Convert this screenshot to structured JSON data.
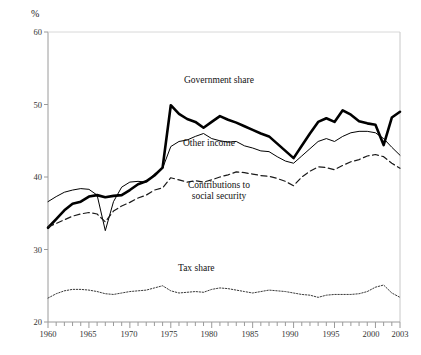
{
  "chart_data": {
    "type": "line",
    "title": "",
    "xlabel": "",
    "ylabel": "%",
    "yunit_label": "%",
    "xlim": [
      1960,
      2003
    ],
    "ylim": [
      20,
      60
    ],
    "grid": false,
    "legend_position": "inline-annotations",
    "y_ticks": [
      20,
      30,
      40,
      50,
      60
    ],
    "y_tick_labels": [
      "20",
      "30",
      "40",
      "50",
      "60"
    ],
    "x_ticks": [
      1960,
      1965,
      1970,
      1975,
      1980,
      1985,
      1990,
      1995,
      2000,
      2003
    ],
    "x_tick_labels": [
      "1960",
      "1965",
      "1970",
      "1975",
      "1980",
      "1985",
      "1990",
      "1995",
      "2000",
      "2003"
    ],
    "x_minor_tick_interval": 1,
    "x": [
      1960,
      1961,
      1962,
      1963,
      1964,
      1965,
      1966,
      1967,
      1968,
      1969,
      1970,
      1971,
      1972,
      1973,
      1974,
      1975,
      1976,
      1977,
      1978,
      1979,
      1980,
      1981,
      1982,
      1983,
      1984,
      1985,
      1986,
      1987,
      1988,
      1989,
      1990,
      1991,
      1992,
      1993,
      1994,
      1995,
      1996,
      1997,
      1998,
      1999,
      2000,
      2001,
      2002,
      2003
    ],
    "series": [
      {
        "name": "Government share",
        "style": "thick-solid",
        "color": "#000000",
        "width": 2.6,
        "values": [
          33.0,
          34.2,
          35.4,
          36.3,
          36.6,
          37.3,
          37.5,
          37.2,
          37.4,
          37.5,
          38.2,
          39.0,
          39.4,
          40.2,
          41.3,
          49.9,
          48.7,
          48.0,
          47.6,
          46.8,
          47.6,
          48.4,
          47.9,
          47.5,
          47.0,
          46.5,
          46.0,
          45.6,
          44.6,
          43.6,
          42.6,
          44.3,
          46.0,
          47.6,
          48.1,
          47.6,
          49.2,
          48.6,
          47.7,
          47.4,
          47.2,
          44.4,
          48.2,
          49.0
        ]
      },
      {
        "name": "Other income",
        "style": "thin-solid",
        "color": "#000000",
        "width": 1.0,
        "values": [
          36.6,
          37.3,
          37.9,
          38.2,
          38.4,
          38.3,
          37.5,
          32.6,
          36.6,
          38.6,
          39.3,
          39.4,
          39.3,
          40.4,
          41.2,
          44.2,
          44.9,
          45.1,
          45.6,
          46.0,
          45.3,
          45.0,
          44.8,
          44.9,
          44.3,
          44.0,
          43.6,
          43.5,
          42.8,
          42.2,
          41.9,
          42.9,
          43.9,
          44.9,
          45.3,
          44.9,
          45.6,
          46.1,
          46.3,
          46.3,
          46.1,
          45.3,
          44.1,
          43.0
        ]
      },
      {
        "name": "Contributions to social security",
        "style": "dashed",
        "color": "#1a1a1a",
        "width": 1.2,
        "values": [
          33.1,
          33.6,
          34.1,
          34.6,
          34.9,
          35.1,
          34.9,
          33.8,
          35.3,
          36.0,
          36.5,
          37.1,
          37.5,
          38.2,
          38.5,
          39.9,
          39.6,
          39.3,
          39.5,
          39.3,
          39.6,
          40.0,
          40.3,
          40.7,
          40.6,
          40.4,
          40.2,
          40.1,
          39.8,
          39.4,
          38.8,
          40.0,
          40.8,
          41.4,
          41.3,
          41.0,
          41.6,
          42.1,
          42.4,
          42.9,
          43.1,
          42.8,
          41.9,
          41.2
        ]
      },
      {
        "name": "Tax share",
        "style": "dotted",
        "color": "#3a3a3a",
        "width": 1.0,
        "values": [
          23.3,
          23.9,
          24.3,
          24.5,
          24.5,
          24.4,
          24.2,
          23.9,
          23.8,
          24.0,
          24.2,
          24.3,
          24.4,
          24.7,
          25.0,
          24.3,
          24.0,
          24.1,
          24.2,
          24.1,
          24.5,
          24.7,
          24.6,
          24.4,
          24.2,
          24.0,
          24.2,
          24.4,
          24.3,
          24.2,
          24.0,
          23.8,
          23.7,
          23.4,
          23.7,
          23.8,
          23.8,
          23.8,
          23.9,
          24.2,
          24.8,
          25.1,
          24.0,
          23.4
        ]
      }
    ],
    "annotations": [
      {
        "id": "government-share",
        "text": "Government share",
        "series": "Government share"
      },
      {
        "id": "other-income",
        "text": "Other income",
        "series": "Other income"
      },
      {
        "id": "contributions-social-security",
        "text": "Contributions to\nsocial security",
        "line1": "Contributions to",
        "line2": "social security",
        "series": "Contributions to social security"
      },
      {
        "id": "tax-share",
        "text": "Tax share",
        "series": "Tax share"
      }
    ]
  },
  "axis": {
    "unit": "%",
    "y_label_60": "60",
    "y_label_50": "50",
    "y_label_40": "40",
    "y_label_30": "30",
    "y_label_20": "20",
    "x_label_1960": "1960",
    "x_label_1965": "1965",
    "x_label_1970": "1970",
    "x_label_1975": "1975",
    "x_label_1980": "1980",
    "x_label_1985": "1985",
    "x_label_1990": "1990",
    "x_label_1995": "1995",
    "x_label_2000": "2000",
    "x_label_2003": "2003"
  },
  "labels": {
    "government_share": "Government share",
    "other_income": "Other income",
    "contributions_line1": "Contributions to",
    "contributions_line2": "social security",
    "tax_share": "Tax share"
  },
  "colors": {
    "background": "#ffffff",
    "axis": "#8c8c8c",
    "ink": "#000000",
    "dotted_ink": "#3a3a3a"
  }
}
